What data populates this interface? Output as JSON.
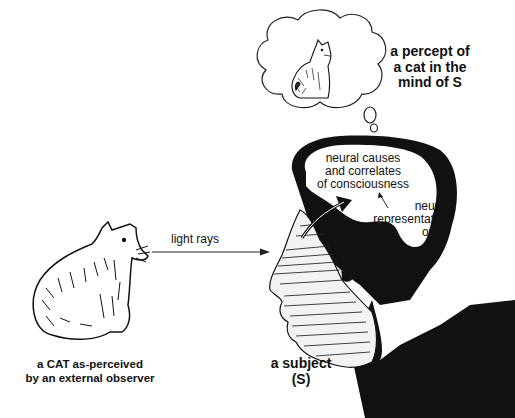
{
  "diagram": {
    "thought_bubble": {
      "label_lines": [
        "a percept of",
        "a cat in the",
        "mind of S"
      ],
      "contents": "cat-drawing"
    },
    "external_cat": {
      "label_lines": [
        "a CAT as-perceived",
        "by an external observer"
      ]
    },
    "arrow_label": "light rays",
    "subject": {
      "label_lines": [
        "a subject",
        "(S)"
      ]
    },
    "brain": {
      "label_lines": [
        "neural causes",
        "and correlates",
        "of consciousness"
      ],
      "representation_lines": [
        "neural",
        "representation",
        "of a",
        "cat"
      ]
    },
    "colors": {
      "ink": "#111111",
      "background": "#ffffff"
    }
  }
}
